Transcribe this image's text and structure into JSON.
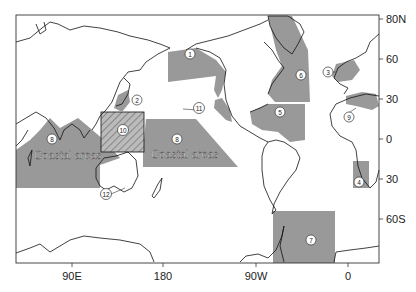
{
  "map": {
    "title": "",
    "y_ticks": [
      "80N",
      "60",
      "30",
      "0",
      "30",
      "60S"
    ],
    "x_ticks": [
      "90E",
      "180",
      "90W",
      "0"
    ],
    "region_fill": "#999999",
    "coastal_label_west": "Coastal areas",
    "coastal_label_east": "Coastal areas",
    "regions": [
      {
        "id": "1",
        "label": "1",
        "name": "Gulf of Alaska / Bering"
      },
      {
        "id": "2",
        "label": "2",
        "name": "Japan Sea"
      },
      {
        "id": "3",
        "label": "3",
        "name": "North Sea / Baltic"
      },
      {
        "id": "4",
        "label": "4",
        "name": "Benguela"
      },
      {
        "id": "5",
        "label": "5",
        "name": "Gulf of Mexico / Caribbean"
      },
      {
        "id": "6a",
        "label": "6",
        "name": "NW Atlantic"
      },
      {
        "id": "7",
        "label": "7",
        "name": "Southern Ocean / Weddell"
      },
      {
        "id": "8a",
        "label": "8",
        "name": "Indian Ocean coastal areas"
      },
      {
        "id": "8b",
        "label": "8",
        "name": "Western Pacific coastal areas"
      },
      {
        "id": "9",
        "label": "9",
        "name": "Mediterranean"
      },
      {
        "id": "10",
        "label": "10",
        "name": "Indo-Pacific hatched box"
      },
      {
        "id": "11",
        "label": "11",
        "name": "California Current"
      },
      {
        "id": "12",
        "label": "12",
        "name": "Southern Australia"
      }
    ]
  }
}
